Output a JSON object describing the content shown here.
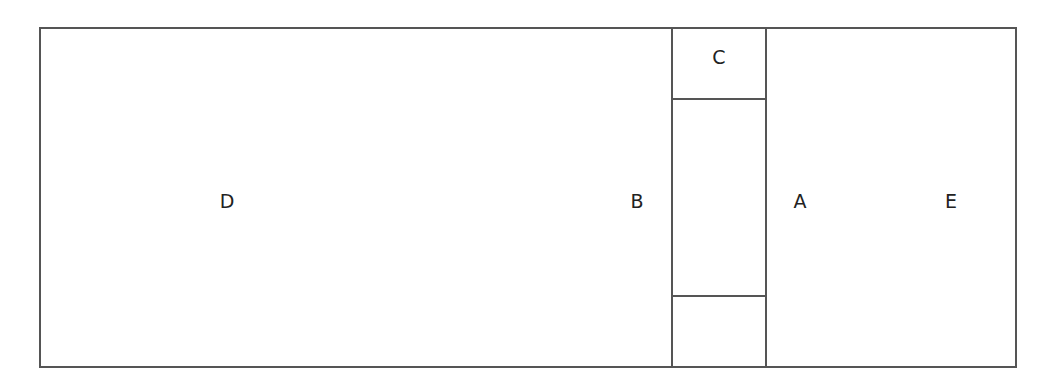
{
  "diagram": {
    "type": "rectangular-partition",
    "line_color": "#555555",
    "text_color": "#222222",
    "outer_rect": {
      "x1": 39,
      "y1": 27,
      "x2": 1015,
      "y2": 367
    },
    "middle_column": {
      "x1": 672,
      "x2": 766,
      "divider_y_top": 99,
      "divider_y_bottom": 296
    },
    "labels": [
      {
        "id": "D",
        "text": "D",
        "x": 227,
        "y": 201
      },
      {
        "id": "B",
        "text": "B",
        "x": 637,
        "y": 201
      },
      {
        "id": "C",
        "text": "C",
        "x": 719,
        "y": 57
      },
      {
        "id": "A",
        "text": "A",
        "x": 800,
        "y": 201
      },
      {
        "id": "E",
        "text": "E",
        "x": 951,
        "y": 201
      }
    ]
  }
}
